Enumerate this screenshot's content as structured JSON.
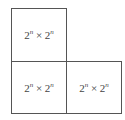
{
  "diagram": {
    "cells": [
      {
        "base": "2",
        "exp": "n",
        "times": "×",
        "base2": "2",
        "exp2": "n"
      },
      {
        "base": "2",
        "exp": "n",
        "times": "×",
        "base2": "2",
        "exp2": "n"
      },
      {
        "base": "2",
        "exp": "n",
        "times": "×",
        "base2": "2",
        "exp2": "n"
      }
    ]
  }
}
